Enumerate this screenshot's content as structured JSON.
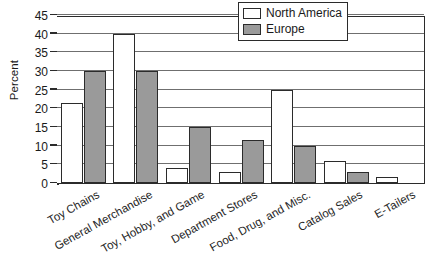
{
  "chart_data": {
    "type": "bar",
    "title": "",
    "subtitle": "",
    "xlabel": "",
    "ylabel": "Percent",
    "ylim": [
      0,
      45
    ],
    "yticks": [
      0,
      5,
      10,
      15,
      20,
      25,
      30,
      35,
      40,
      45
    ],
    "ytick_labels": [
      "0",
      "5",
      "10",
      "15",
      "20",
      "25",
      "30",
      "35",
      "40",
      "45"
    ],
    "grid": true,
    "grid_axis": "y",
    "legend_position": "top-right-inside",
    "categories": [
      "Toy Chains",
      "General Merchandise",
      "Toy, Hobby, and Game",
      "Department Stores",
      "Food, Drug, and Misc.",
      "Catalog Sales",
      "E-Tailers"
    ],
    "series": [
      {
        "name": "North America",
        "color": "#ffffff",
        "edge_color": "#2b2b2b",
        "values": [
          21.5,
          40,
          4,
          3,
          25,
          6,
          1.5
        ]
      },
      {
        "name": "Europe",
        "color": "#9a9a9a",
        "edge_color": "#2b2b2b",
        "values": [
          30,
          30,
          15,
          11.5,
          10,
          3,
          0
        ]
      }
    ]
  },
  "legend": {
    "entries": [
      {
        "label": "North America",
        "swatch": "north-america-swatch"
      },
      {
        "label": "Europe",
        "swatch": "europe-swatch"
      }
    ]
  },
  "colors": {
    "axis": "#2b2b2b",
    "grid": "#6f6f6f",
    "series_north_america": "#ffffff",
    "series_europe": "#9a9a9a",
    "background": "#ffffff",
    "text": "#1a1a1a"
  }
}
